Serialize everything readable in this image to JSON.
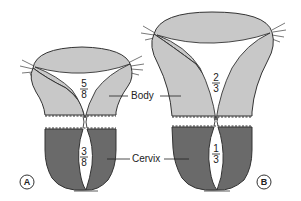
{
  "diagram": {
    "type": "comparative anatomical diagram",
    "colors": {
      "body_fill": "#c8c8c8",
      "cervix_fill": "#6a6a6a",
      "outline": "#333333",
      "background": "#ffffff"
    },
    "labels": {
      "body": "Body",
      "cervix": "Cervix"
    },
    "panels": [
      {
        "id": "A",
        "panel_label": "A",
        "body_fraction": {
          "num": "5",
          "den": "8"
        },
        "cervix_fraction": {
          "num": "3",
          "den": "8"
        }
      },
      {
        "id": "B",
        "panel_label": "B",
        "body_fraction": {
          "num": "2",
          "den": "3"
        },
        "cervix_fraction": {
          "num": "1",
          "den": "3"
        }
      }
    ]
  }
}
